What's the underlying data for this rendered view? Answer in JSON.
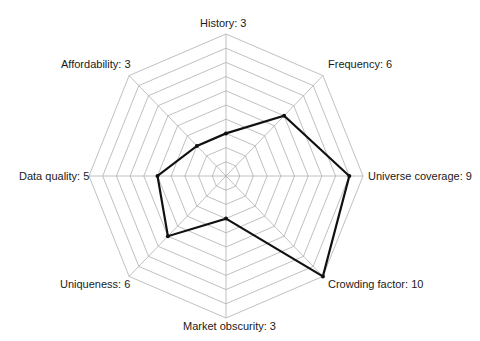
{
  "chart_data": {
    "type": "radar",
    "title": "",
    "categories": [
      "History",
      "Frequency",
      "Universe coverage",
      "Crowding factor",
      "Market obscurity",
      "Uniqueness",
      "Data quality",
      "Affordability"
    ],
    "values": [
      3,
      6,
      9,
      10,
      3,
      6,
      5,
      3
    ],
    "labels": [
      "History: 3",
      "Frequency: 6",
      "Universe coverage: 9",
      "Crowding factor: 10",
      "Market obscurity: 3",
      "Uniqueness: 6",
      "Data quality: 5",
      "Affordability: 3"
    ],
    "rlim": [
      0,
      10
    ],
    "rings": 10,
    "grid": true,
    "legend": "none",
    "colors": {
      "series": "#111111",
      "grid": "#b0b0b0"
    }
  }
}
